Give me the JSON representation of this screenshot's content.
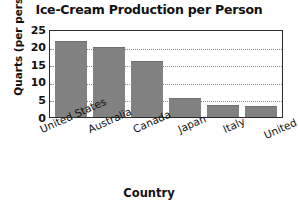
{
  "chart_data": {
    "type": "bar",
    "title": "Ice-Cream Production per Person",
    "xlabel": "Country",
    "ylabel": "Quarts (per person)",
    "categories": [
      "United States",
      "Australia",
      "Canada",
      "Japan",
      "Italy",
      "United Kingdom"
    ],
    "values": [
      21.5,
      20,
      16,
      5.3,
      3.5,
      3.2
    ],
    "ylim": [
      0,
      25
    ],
    "yticks": [
      25,
      20,
      15,
      10,
      5,
      0
    ],
    "grid": true,
    "legend": false,
    "bar_color": "#818181",
    "axis_color": "#2b2b2b",
    "gridline_color": "#8d8d8d",
    "background": "#ffffff"
  }
}
